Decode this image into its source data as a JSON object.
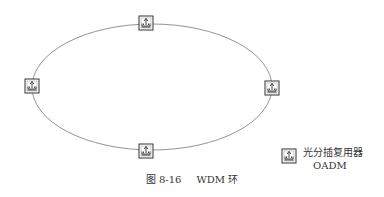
{
  "diagram": {
    "type": "ring-network",
    "ring_label": "WDM 环",
    "nodes": [
      {
        "id": "top",
        "type": "OADM",
        "position": "top"
      },
      {
        "id": "left",
        "type": "OADM",
        "position": "left"
      },
      {
        "id": "right",
        "type": "OADM",
        "position": "right"
      },
      {
        "id": "bottom",
        "type": "OADM",
        "position": "bottom"
      }
    ],
    "edges": [
      {
        "from": "top",
        "to": "right"
      },
      {
        "from": "right",
        "to": "bottom"
      },
      {
        "from": "bottom",
        "to": "left"
      },
      {
        "from": "left",
        "to": "top"
      }
    ]
  },
  "legend": {
    "icon": "oadm-icon",
    "label_cn": "光分插复用器",
    "label_en": "OADM"
  },
  "caption": {
    "figure_number": "图 8-16",
    "title": "WDM 环"
  },
  "colors": {
    "line": "#777777",
    "box": "#333333",
    "text": "#333333"
  }
}
